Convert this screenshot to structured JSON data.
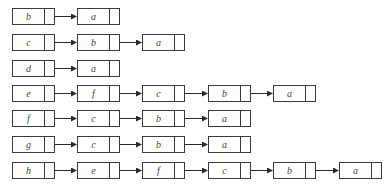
{
  "diagram": {
    "title": "",
    "type": "adjacency-list",
    "rows": [
      {
        "head": "b",
        "list": [
          "a"
        ]
      },
      {
        "head": "c",
        "list": [
          "b",
          "a"
        ]
      },
      {
        "head": "d",
        "list": [
          "a"
        ]
      },
      {
        "head": "e",
        "list": [
          "f",
          "c",
          "b",
          "a"
        ]
      },
      {
        "head": "f",
        "list": [
          "c",
          "b",
          "a"
        ]
      },
      {
        "head": "g",
        "list": [
          "c",
          "b",
          "a"
        ]
      },
      {
        "head": "h",
        "list": [
          "e",
          "f",
          "c",
          "b",
          "a"
        ]
      }
    ],
    "colors": {
      "stroke": "#3a3a3a",
      "text": "#444444",
      "background": "#ffffff"
    }
  }
}
